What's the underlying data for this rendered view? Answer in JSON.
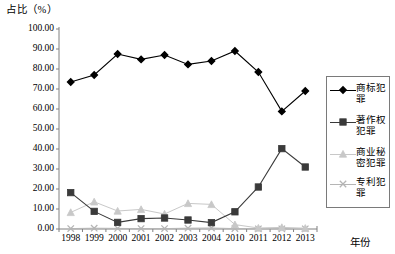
{
  "chart_data": {
    "type": "line",
    "title": "",
    "ylabel": "占比（%）",
    "xlabel": "年份",
    "categories": [
      "1998",
      "1999",
      "2000",
      "2001",
      "2002",
      "2003",
      "2004",
      "2010",
      "2011",
      "2012",
      "2013"
    ],
    "yticks": [
      "0.00",
      "10.00",
      "20.00",
      "30.00",
      "40.00",
      "50.00",
      "60.00",
      "70.00",
      "80.00",
      "90.00",
      "100.00"
    ],
    "ylim": [
      0,
      100
    ],
    "ytick_step": 10,
    "grid": false,
    "legend_position": "right",
    "series": [
      {
        "name": "商标犯罪",
        "marker": "diamond",
        "color": "#000000",
        "values": [
          73.5,
          77.0,
          87.5,
          84.8,
          87.0,
          82.3,
          84.0,
          89.0,
          78.5,
          58.8,
          69.0
        ]
      },
      {
        "name": "著作权犯罪",
        "marker": "square",
        "color": "#3a3a3a",
        "values": [
          18.2,
          8.8,
          3.3,
          5.2,
          5.5,
          4.5,
          3.2,
          8.6,
          21.0,
          40.2,
          31.0
        ]
      },
      {
        "name": "商业秘密犯罪",
        "marker": "triangle",
        "color": "#c8c8c8",
        "values": [
          8.3,
          13.6,
          9.0,
          9.8,
          7.5,
          12.8,
          12.3,
          2.2,
          0.5,
          0.8,
          0.4
        ]
      },
      {
        "name": "专利犯罪",
        "marker": "cross",
        "color": "#b5b5b5",
        "values": [
          0.2,
          0.4,
          0.3,
          0.2,
          0.2,
          0.4,
          0.5,
          0.2,
          0.1,
          0.1,
          0.1
        ]
      }
    ]
  },
  "legend": {
    "items": [
      {
        "label": "商标犯罪"
      },
      {
        "label": "著作权犯罪"
      },
      {
        "label": "商业秘密犯罪"
      },
      {
        "label": "专利犯罪"
      }
    ]
  }
}
